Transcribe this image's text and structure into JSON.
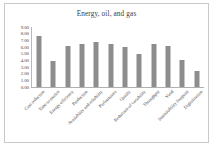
{
  "chart": {
    "title": "Energy, oil, and gas"
  },
  "chart_data": {
    "type": "bar",
    "title": "Energy, oil, and gas",
    "xlabel": "",
    "ylabel": "",
    "ylim": [
      0,
      9
    ],
    "grid": false,
    "legend": null,
    "legend_position": "none",
    "ytick_labels": [
      "9.00",
      "8.00",
      "7.00",
      "6.00",
      "5.00",
      "4.00",
      "3.00",
      "2.00",
      "1.00",
      "0.00"
    ],
    "ytick_values": [
      9,
      8,
      7,
      6,
      5,
      4,
      3,
      2,
      1,
      0
    ],
    "categories": [
      "Cost reduction",
      "Time to market",
      "Energy efficiency",
      "Production",
      "Availability and reliability",
      "Performance",
      "Quality",
      "Reduction of variability",
      "Throughput",
      "Yield",
      "Sustainability footprint",
      "Digitalization"
    ],
    "values": [
      7.7,
      3.9,
      6.1,
      6.4,
      6.8,
      6.4,
      6.0,
      5.0,
      6.4,
      6.2,
      4.1,
      2.4
    ],
    "bar_color": "#8d8d8d"
  }
}
